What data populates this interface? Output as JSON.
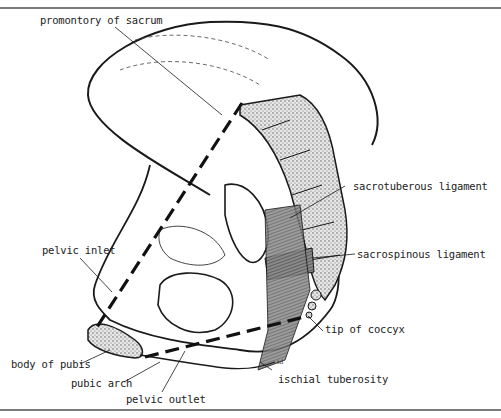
{
  "figure": {
    "artist_signature": "td",
    "colors": {
      "ink": "#1a1a1a",
      "rule": "#7a7a7a",
      "bone_fill": "#d9d9d9",
      "background": "#ffffff"
    }
  },
  "labels": [
    {
      "id": "promontory-of-sacrum",
      "text": "promontory of sacrum"
    },
    {
      "id": "sacrotuberous-ligament",
      "text": "sacrotuberous ligament"
    },
    {
      "id": "sacrospinous-ligament",
      "text": "sacrospinous ligament"
    },
    {
      "id": "pelvic-inlet",
      "text": "pelvic inlet"
    },
    {
      "id": "tip-of-coccyx",
      "text": "tip of coccyx"
    },
    {
      "id": "body-of-pubis",
      "text": "body of pubis"
    },
    {
      "id": "pubic-arch",
      "text": "pubic arch"
    },
    {
      "id": "ischial-tuberosity",
      "text": "ischial tuberosity"
    },
    {
      "id": "pelvic-outlet",
      "text": "pelvic outlet"
    }
  ]
}
